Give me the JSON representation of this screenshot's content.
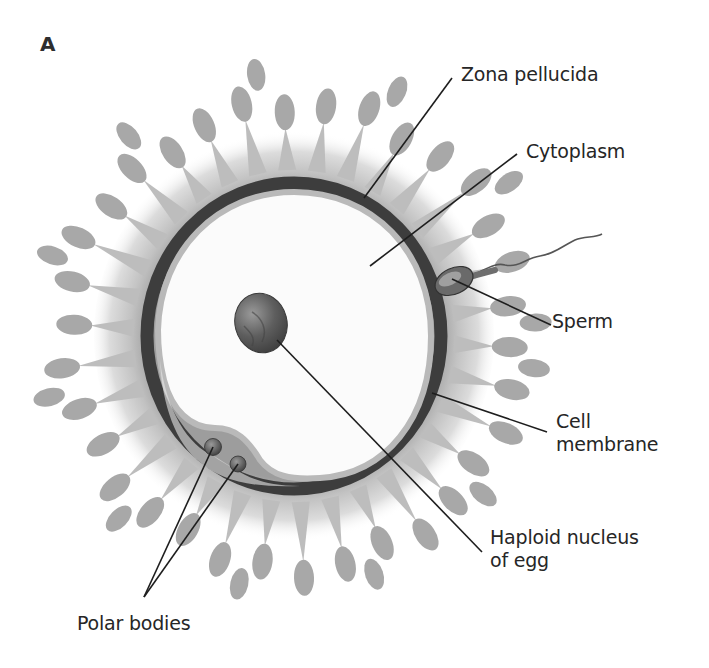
{
  "figure": {
    "panel_letter": "A",
    "labels": {
      "zona_pellucida": "Zona pellucida",
      "cytoplasm": "Cytoplasm",
      "sperm": "Sperm",
      "cell_membrane_line1": "Cell",
      "cell_membrane_line2": "membrane",
      "haploid_line1": "Haploid nucleus",
      "haploid_line2": "of egg",
      "polar_bodies": "Polar bodies"
    },
    "colors": {
      "zona": "#3d3d3d",
      "membrane": "#b9b9b9",
      "corona": "#b3b3b3",
      "cytoplasm": "#fbfbfb",
      "nucleus": "#5a5a5a",
      "leader_lines": "#1e1e1e",
      "text": "#262626"
    }
  }
}
